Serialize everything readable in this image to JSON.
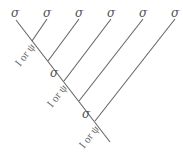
{
  "diagram": {
    "type": "fusion-tree",
    "top_labels": [
      "σ",
      "σ",
      "σ",
      "σ",
      "σ",
      "σ"
    ],
    "edge_labels": [
      {
        "text": "I or ψ",
        "x": 27,
        "y": 58
      },
      {
        "text": "I or ψ",
        "x": 59,
        "y": 99
      },
      {
        "text": "I or ψ",
        "x": 91,
        "y": 140
      }
    ],
    "node_labels": [
      {
        "text": "σ",
        "x": 50,
        "y": 77
      },
      {
        "text": "σ",
        "x": 82,
        "y": 118
      }
    ],
    "line_color": "#666666"
  }
}
